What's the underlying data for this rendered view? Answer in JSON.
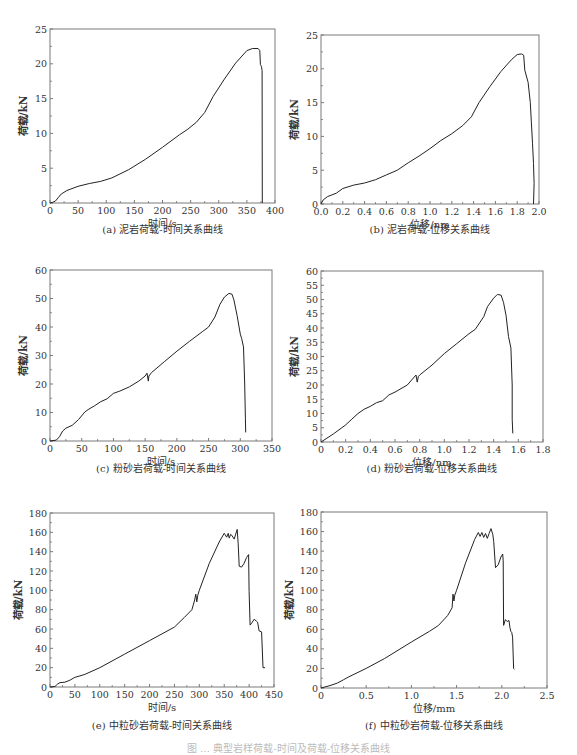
{
  "figure": {
    "main_caption": "图 … 典型岩样荷载-时间及荷载-位移关系曲线",
    "panels": [
      {
        "id": "a",
        "caption": "(a)  泥岩荷载-时间关系曲线"
      },
      {
        "id": "b",
        "caption": "(b)  泥岩荷载-位移关系曲线"
      },
      {
        "id": "c",
        "caption": "(c)  粉砂岩荷载-时间关系曲线"
      },
      {
        "id": "d",
        "caption": "(d)  粉砂岩荷载-位移关系曲线"
      },
      {
        "id": "e",
        "caption": "(e)  中粒砂岩荷载-时间关系曲线"
      },
      {
        "id": "f",
        "caption": "(f)  中粒砂岩荷载-位移关系曲线"
      }
    ]
  },
  "chart_data": [
    {
      "id": "a",
      "type": "line",
      "title": "(a) 泥岩荷载-时间关系曲线",
      "xlabel": "时间/s",
      "ylabel": "荷载/kN",
      "xlim": [
        0,
        400
      ],
      "ylim": [
        0,
        25
      ],
      "xticks": [
        0,
        50,
        100,
        150,
        200,
        250,
        300,
        350,
        400
      ],
      "yticks": [
        0,
        5,
        10,
        15,
        20,
        25
      ],
      "xtick_labels": [
        "0",
        "50",
        "100",
        "150",
        "200",
        "250",
        "300",
        "350",
        "400"
      ],
      "ytick_labels": [
        "0",
        "5",
        "10",
        "15",
        "20",
        "25"
      ],
      "grid": false,
      "legend": null,
      "frame": {
        "left": 50,
        "top": 29,
        "right": 275,
        "bottom": 203
      },
      "series": [
        {
          "name": "泥岩",
          "x": [
            0,
            5,
            10,
            15,
            20,
            30,
            50,
            70,
            90,
            110,
            140,
            170,
            200,
            230,
            245,
            260,
            275,
            290,
            310,
            330,
            350,
            360,
            370,
            373,
            374,
            376,
            377,
            377.5
          ],
          "y": [
            0,
            0.1,
            0.3,
            0.8,
            1.3,
            1.8,
            2.4,
            2.8,
            3.1,
            3.6,
            4.8,
            6.3,
            8.0,
            9.8,
            10.6,
            11.6,
            13.0,
            15.3,
            17.8,
            20.1,
            21.9,
            22.2,
            22.2,
            21.9,
            19.9,
            19.6,
            19.0,
            0
          ]
        }
      ]
    },
    {
      "id": "b",
      "type": "line",
      "title": "(b) 泥岩荷载-位移关系曲线",
      "xlabel": "位移/nm",
      "ylabel": "荷载/kN",
      "xlim": [
        0,
        2.0
      ],
      "ylim": [
        0,
        25
      ],
      "xticks": [
        0,
        0.2,
        0.4,
        0.6,
        0.8,
        1.0,
        1.2,
        1.4,
        1.6,
        1.8,
        2.0
      ],
      "yticks": [
        0,
        5,
        10,
        15,
        20,
        25
      ],
      "xtick_labels": [
        "0.0",
        "0.2",
        "0.4",
        "0.6",
        "0.8",
        "1.0",
        "1.2",
        "1.4",
        "1.6",
        "1.8",
        "2.0"
      ],
      "ytick_labels": [
        "0",
        "5",
        "10",
        "15",
        "20",
        "25"
      ],
      "grid": false,
      "legend": null,
      "frame": {
        "left": 321,
        "top": 35,
        "right": 539,
        "bottom": 204
      },
      "series": [
        {
          "name": "泥岩",
          "x": [
            0,
            0.02,
            0.06,
            0.14,
            0.2,
            0.3,
            0.4,
            0.5,
            0.6,
            0.7,
            0.8,
            0.9,
            1.0,
            1.1,
            1.2,
            1.3,
            1.38,
            1.45,
            1.55,
            1.65,
            1.75,
            1.8,
            1.84,
            1.86,
            1.87,
            1.9,
            1.92,
            1.93,
            1.94,
            1.95,
            1.955,
            1.95
          ],
          "y": [
            0,
            0.6,
            1.1,
            1.6,
            2.3,
            2.8,
            3.1,
            3.6,
            4.3,
            5.0,
            6.1,
            7.1,
            8.2,
            9.4,
            10.4,
            11.6,
            12.9,
            15.0,
            17.4,
            19.6,
            21.4,
            22.1,
            22.2,
            22.0,
            19.8,
            18.0,
            15.0,
            12.0,
            9.0,
            6.0,
            3.0,
            0
          ]
        }
      ]
    },
    {
      "id": "c",
      "type": "line",
      "title": "(c) 粉砂岩荷载-时间关系曲线",
      "xlabel": "时间/s",
      "ylabel": "荷载/kN",
      "xlim": [
        0,
        350
      ],
      "ylim": [
        0,
        60
      ],
      "xticks": [
        0,
        50,
        100,
        150,
        200,
        250,
        300,
        350
      ],
      "yticks": [
        0,
        10,
        20,
        30,
        40,
        50,
        60
      ],
      "xtick_labels": [
        "0",
        "50",
        "100",
        "150",
        "200",
        "250",
        "300",
        "350"
      ],
      "ytick_labels": [
        "0",
        "10",
        "20",
        "30",
        "40",
        "50",
        "60"
      ],
      "grid": false,
      "legend": null,
      "frame": {
        "left": 50,
        "top": 270,
        "right": 272,
        "bottom": 441
      },
      "series": [
        {
          "name": "粉砂岩",
          "x": [
            0,
            10,
            15,
            20,
            25,
            35,
            45,
            55,
            60,
            70,
            80,
            90,
            100,
            110,
            125,
            140,
            150,
            153,
            155,
            156,
            160,
            180,
            200,
            220,
            240,
            250,
            260,
            268,
            275,
            282,
            287,
            290,
            295,
            300,
            302,
            305,
            307,
            308,
            308.5
          ],
          "y": [
            0,
            0.3,
            1.5,
            3.5,
            4.5,
            5.5,
            7.5,
            10.2,
            11.0,
            12.3,
            13.8,
            14.8,
            16.7,
            17.5,
            19.0,
            21.0,
            22.8,
            23.8,
            21.0,
            22.8,
            24.0,
            27.8,
            31.5,
            35.0,
            38.3,
            40.0,
            43.5,
            48.0,
            50.5,
            51.8,
            51.5,
            49.5,
            44.0,
            37.5,
            36.0,
            33.0,
            20.0,
            8.0,
            3.0
          ]
        }
      ]
    },
    {
      "id": "d",
      "type": "line",
      "title": "(d) 粉砂岩荷载-位移关系曲线",
      "xlabel": "位移/nm",
      "ylabel": "荷载/kN",
      "xlim": [
        0,
        1.8
      ],
      "ylim": [
        0,
        60
      ],
      "xticks": [
        0,
        0.2,
        0.4,
        0.6,
        0.8,
        1.0,
        1.2,
        1.4,
        1.6,
        1.8
      ],
      "yticks": [
        0,
        5,
        10,
        15,
        20,
        25,
        30,
        35,
        40,
        45,
        50,
        55,
        60
      ],
      "xtick_labels": [
        "0",
        "0.2",
        "0.4",
        "0.6",
        "0.8",
        "1.0",
        "1.2",
        "1.4",
        "1.6",
        "1.8"
      ],
      "ytick_labels": [
        "0",
        "5",
        "10",
        "15",
        "20",
        "25",
        "30",
        "35",
        "40",
        "45",
        "50",
        "55",
        "60"
      ],
      "grid": false,
      "legend": null,
      "frame": {
        "left": 321,
        "top": 271,
        "right": 543,
        "bottom": 442
      },
      "series": [
        {
          "name": "粉砂岩",
          "x": [
            0,
            0.1,
            0.2,
            0.25,
            0.3,
            0.35,
            0.4,
            0.45,
            0.5,
            0.55,
            0.6,
            0.7,
            0.77,
            0.78,
            0.79,
            0.8,
            0.9,
            1.0,
            1.1,
            1.2,
            1.25,
            1.32,
            1.35,
            1.4,
            1.43,
            1.46,
            1.48,
            1.5,
            1.52,
            1.54,
            1.55,
            1.55,
            1.555
          ],
          "y": [
            0,
            2.8,
            6.0,
            8.0,
            10.0,
            11.5,
            12.5,
            13.8,
            14.5,
            16.5,
            17.5,
            20.0,
            23.5,
            21.0,
            23.0,
            23.5,
            27.0,
            31.0,
            34.5,
            38.0,
            39.5,
            44.0,
            47.5,
            50.5,
            51.8,
            51.5,
            49.0,
            44.5,
            37.0,
            33.0,
            20.0,
            8.0,
            3.0
          ]
        }
      ]
    },
    {
      "id": "e",
      "type": "line",
      "title": "(e) 中粒砂岩荷载-时间关系曲线",
      "xlabel": "时间/s",
      "ylabel": "荷载/kN",
      "xlim": [
        0,
        450
      ],
      "ylim": [
        0,
        180
      ],
      "xticks": [
        0,
        50,
        100,
        150,
        200,
        250,
        300,
        350,
        400,
        450
      ],
      "yticks": [
        0,
        20,
        40,
        60,
        80,
        100,
        120,
        140,
        160,
        180
      ],
      "xtick_labels": [
        "0",
        "50",
        "100",
        "150",
        "200",
        "250",
        "300",
        "350",
        "400",
        "450"
      ],
      "ytick_labels": [
        "0",
        "20",
        "40",
        "60",
        "80",
        "100",
        "120",
        "140",
        "160",
        "180"
      ],
      "grid": false,
      "legend": null,
      "frame": {
        "left": 50,
        "top": 513,
        "right": 274,
        "bottom": 687
      },
      "series": [
        {
          "name": "中粒砂岩",
          "x": [
            0,
            10,
            15,
            20,
            30,
            40,
            50,
            60,
            70,
            100,
            150,
            200,
            250,
            270,
            285,
            290,
            293,
            295,
            297,
            300,
            320,
            340,
            350,
            355,
            358,
            360,
            363,
            365,
            370,
            376,
            378,
            380,
            385,
            390,
            395,
            399,
            400,
            402,
            405,
            410,
            415,
            417,
            420,
            425,
            428,
            432
          ],
          "y": [
            0,
            0.5,
            3,
            4.5,
            5,
            7,
            10,
            11.5,
            13,
            20,
            34,
            48,
            62,
            72,
            80,
            89,
            96,
            88,
            95,
            100,
            128,
            150,
            159,
            155,
            159,
            154,
            158,
            157,
            153,
            163,
            148,
            125,
            124,
            128,
            134,
            137,
            99,
            64,
            66,
            70,
            68,
            67,
            58,
            57,
            20,
            20
          ]
        }
      ]
    },
    {
      "id": "f",
      "type": "line",
      "title": "(f) 中粒砂岩荷载-位移关系曲线",
      "xlabel": "位移/mm",
      "ylabel": "荷载/kN",
      "xlim": [
        0,
        2.5
      ],
      "ylim": [
        0,
        180
      ],
      "xticks": [
        0,
        0.5,
        1.0,
        1.5,
        2.0,
        2.5
      ],
      "yticks": [
        0,
        20,
        40,
        60,
        80,
        100,
        120,
        140,
        160,
        180
      ],
      "xtick_labels": [
        "0",
        "0.5",
        "1.0",
        "1.5",
        "2.0",
        "2.5"
      ],
      "ytick_labels": [
        "0",
        "20",
        "40",
        "60",
        "80",
        "100",
        "120",
        "140",
        "160",
        "180"
      ],
      "grid": false,
      "legend": null,
      "frame": {
        "left": 321,
        "top": 512,
        "right": 547,
        "bottom": 688
      },
      "series": [
        {
          "name": "中粒砂岩",
          "x": [
            0,
            0.1,
            0.18,
            0.25,
            0.3,
            0.5,
            0.7,
            1.0,
            1.2,
            1.3,
            1.4,
            1.45,
            1.46,
            1.47,
            1.48,
            1.5,
            1.6,
            1.7,
            1.74,
            1.76,
            1.78,
            1.8,
            1.82,
            1.84,
            1.86,
            1.88,
            1.9,
            1.91,
            1.93,
            1.96,
            1.99,
            2.01,
            2.015,
            2.02,
            2.04,
            2.06,
            2.08,
            2.09,
            2.1,
            2.11,
            2.12,
            2.13,
            2.14
          ],
          "y": [
            0,
            2.5,
            5,
            8.5,
            11,
            20,
            30,
            47,
            58,
            64,
            74,
            82,
            96,
            89,
            95,
            100,
            128,
            152,
            159,
            155,
            159,
            154,
            158,
            153,
            158,
            163,
            157,
            150,
            123,
            126,
            134,
            137,
            130,
            64,
            70,
            68,
            69,
            62,
            58,
            57,
            52,
            20,
            19
          ]
        }
      ]
    }
  ]
}
